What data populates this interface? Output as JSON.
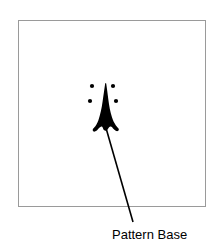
{
  "figure": {
    "title": "",
    "canvas": {
      "width": 222,
      "height": 249,
      "background": "#ffffff"
    },
    "frame": {
      "name": "pattern-frame",
      "x": 18,
      "y": 20,
      "width": 187,
      "height": 186,
      "stroke": "#9a9a9a",
      "stroke_width": 1,
      "fill": "#ffffff"
    },
    "shape": {
      "name": "arrowhead-silhouette",
      "description": "black spearhead / arrowhead pattern",
      "fill": "#000000",
      "tip": {
        "x": 105,
        "y": 84
      },
      "base_y": 129,
      "width": 26
    },
    "dots": [
      {
        "name": "dot-upper-left",
        "cx": 92,
        "cy": 86,
        "r": 2.1,
        "fill": "#000000"
      },
      {
        "name": "dot-upper-right",
        "cx": 113,
        "cy": 86,
        "r": 2.1,
        "fill": "#000000"
      },
      {
        "name": "dot-lower-left",
        "cx": 90,
        "cy": 101,
        "r": 2.1,
        "fill": "#000000"
      },
      {
        "name": "dot-lower-right",
        "cx": 116,
        "cy": 101,
        "r": 2.1,
        "fill": "#000000"
      }
    ],
    "leader_line": {
      "name": "pattern-base-leader-line",
      "x1": 106,
      "y1": 128,
      "x2": 133,
      "y2": 222,
      "stroke": "#000000",
      "stroke_width": 1.6
    },
    "caption": {
      "label": "Pattern Base",
      "x": 112,
      "y": 227,
      "color": "#000000",
      "font_size": 13
    }
  }
}
